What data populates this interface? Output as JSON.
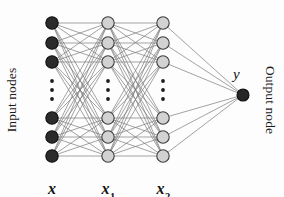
{
  "figure": {
    "type": "neural-network-diagram",
    "background_color": "#fdfdfd",
    "width": 284,
    "height": 197
  },
  "labels": {
    "input_side": "Input nodes",
    "output_side": "Output node",
    "output_variable": "y",
    "layer_captions": [
      {
        "base": "x",
        "sub": ""
      },
      {
        "base": "x",
        "sub": "1"
      },
      {
        "base": "x",
        "sub": "2"
      }
    ]
  },
  "colors": {
    "input_node_fill": "#2b2b2b",
    "input_node_stroke": "#101010",
    "hidden_node_fill": "#d2d2d2",
    "hidden_node_stroke": "#3c3c3c",
    "output_node_fill": "#262626",
    "output_node_stroke": "#0d0d0d",
    "edge": "#7b7b7b",
    "dot": "#1c1c1c",
    "text": "#1b1b1b"
  },
  "geometry": {
    "node_radius": 6.2,
    "output_node_radius": 6.0,
    "edge_width": 0.7,
    "columns": [
      {
        "name": "input",
        "x": 52
      },
      {
        "name": "hidden1",
        "x": 108
      },
      {
        "name": "hidden2",
        "x": 163
      }
    ],
    "output_x": 243,
    "output_y": 95,
    "node_rows_y": [
      23,
      43,
      62,
      118,
      137,
      156
    ],
    "ellipsis_dots_y": [
      81,
      90,
      99
    ],
    "caption_y": 180
  },
  "structure": {
    "layers": [
      {
        "id": "input",
        "label": "x",
        "visible_nodes": 6,
        "has_ellipsis": true,
        "style": "filled-dark"
      },
      {
        "id": "hidden1",
        "label": "x1",
        "visible_nodes": 6,
        "has_ellipsis": true,
        "style": "filled-light"
      },
      {
        "id": "hidden2",
        "label": "x2",
        "visible_nodes": 6,
        "has_ellipsis": true,
        "style": "filled-light"
      },
      {
        "id": "output",
        "label": "y",
        "visible_nodes": 1,
        "has_ellipsis": false,
        "style": "filled-dark"
      }
    ],
    "connections": [
      {
        "from": "input",
        "to": "hidden1",
        "pattern": "fully-connected"
      },
      {
        "from": "hidden1",
        "to": "hidden2",
        "pattern": "fully-connected"
      },
      {
        "from": "hidden2",
        "to": "output",
        "pattern": "fully-connected"
      }
    ]
  }
}
